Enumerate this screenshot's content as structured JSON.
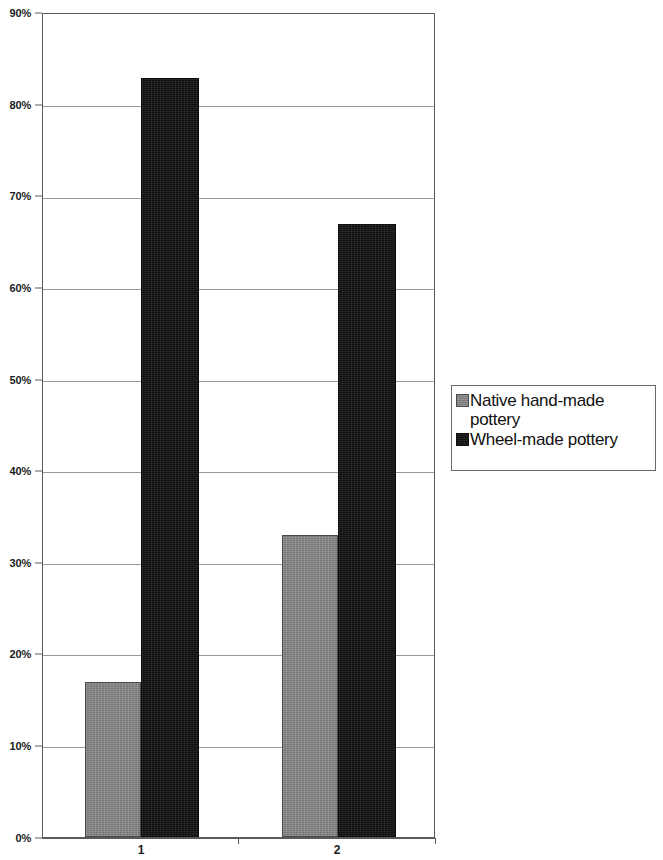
{
  "chart_data": {
    "type": "bar",
    "title": "",
    "subtitle": "",
    "xlabel": "",
    "ylabel": "",
    "categories": [
      "1",
      "2"
    ],
    "series": [
      {
        "name": "Native hand-made pottery",
        "values": [
          17,
          33
        ],
        "color": "#858585"
      },
      {
        "name": "Wheel-made pottery",
        "values": [
          83,
          67
        ],
        "color": "#171717"
      }
    ],
    "ylim": [
      0,
      90
    ],
    "ytick_values": [
      0,
      10,
      20,
      30,
      40,
      50,
      60,
      70,
      80,
      90
    ],
    "ytick_labels": [
      "0%",
      "10%",
      "20%",
      "30%",
      "40%",
      "50%",
      "60%",
      "70%",
      "80%",
      "90%"
    ],
    "grid": true,
    "grid_axis": "y",
    "legend_position": "right",
    "value_format": "percent",
    "annotations": []
  },
  "legend": {
    "entries": [
      {
        "label": "Native hand-made pottery",
        "swatch": "series-native"
      },
      {
        "label": "Wheel-made pottery",
        "swatch": "series-wheel"
      }
    ]
  },
  "axes": {
    "y": {
      "ticks": [
        {
          "label": "90%",
          "value": 90
        },
        {
          "label": "80%",
          "value": 80
        },
        {
          "label": "70%",
          "value": 70
        },
        {
          "label": "60%",
          "value": 60
        },
        {
          "label": "50%",
          "value": 50
        },
        {
          "label": "40%",
          "value": 40
        },
        {
          "label": "30%",
          "value": 30
        },
        {
          "label": "20%",
          "value": 20
        },
        {
          "label": "10%",
          "value": 10
        },
        {
          "label": "0%",
          "value": 0
        }
      ]
    },
    "x": {
      "ticks": [
        {
          "label": "1"
        },
        {
          "label": "2"
        }
      ]
    }
  }
}
